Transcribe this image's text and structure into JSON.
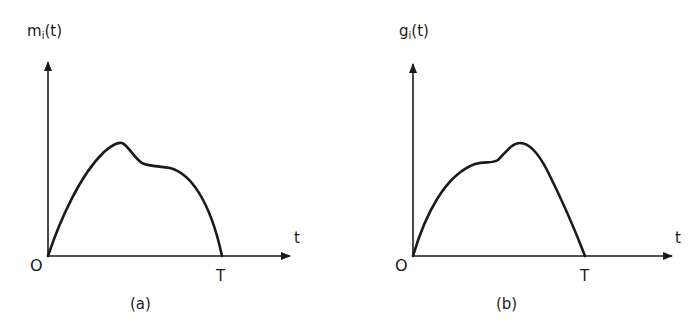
{
  "figure": {
    "panels": [
      {
        "id": "a",
        "caption": "(a)",
        "ylabel_base": "m",
        "ylabel_sub": "i",
        "ylabel_arg": "(t)",
        "xlabel": "t",
        "origin_label": "O",
        "end_label": "T",
        "curve_description": "Rises from O to an early peak, then drops to a lower shoulder and falls to zero at T"
      },
      {
        "id": "b",
        "caption": "(b)",
        "ylabel_base": "g",
        "ylabel_sub": "i",
        "ylabel_arg": "(t)",
        "xlabel": "t",
        "origin_label": "O",
        "end_label": "T",
        "curve_description": "Rises from O to an early shoulder, then climbs to a later peak and falls to zero at T (time-reversed mirror of (a))"
      }
    ],
    "colors": {
      "ink": "#1a1a1a",
      "background": "#ffffff"
    }
  }
}
